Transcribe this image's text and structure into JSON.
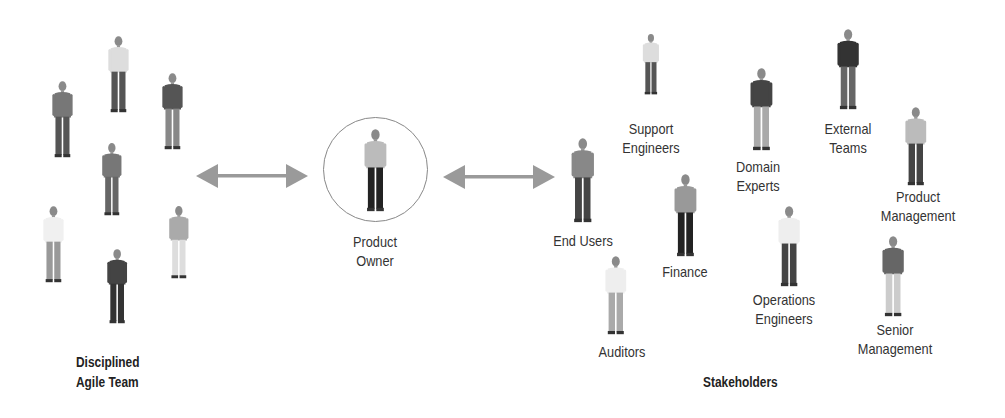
{
  "team": {
    "title": "Disciplined\nAgile Team",
    "members": [
      {
        "x": 62,
        "y": 80,
        "h": 78,
        "top": "#777",
        "bottom": "#555"
      },
      {
        "x": 118,
        "y": 35,
        "h": 78,
        "top": "#ddd",
        "bottom": "#555"
      },
      {
        "x": 172,
        "y": 72,
        "h": 78,
        "top": "#555",
        "bottom": "#888"
      },
      {
        "x": 112,
        "y": 142,
        "h": 74,
        "top": "#777",
        "bottom": "#666"
      },
      {
        "x": 53,
        "y": 205,
        "h": 78,
        "top": "#f0f0f0",
        "bottom": "#999"
      },
      {
        "x": 179,
        "y": 205,
        "h": 74,
        "top": "#aaa",
        "bottom": "#ddd"
      },
      {
        "x": 117,
        "y": 248,
        "h": 76,
        "top": "#444",
        "bottom": "#333"
      }
    ]
  },
  "product_owner": {
    "label": "Product\nOwner"
  },
  "stakeholders": {
    "title": "Stakeholders",
    "items": [
      {
        "label": "Support\nEngineers",
        "fx": 651,
        "fy": 33,
        "fh": 62,
        "lx": 651,
        "ly": 119,
        "top": "#ddd",
        "bottom": "#555"
      },
      {
        "label": "End Users",
        "fx": 583,
        "fy": 137,
        "fh": 86,
        "lx": 583,
        "ly": 231,
        "top": "#888",
        "bottom": "#444"
      },
      {
        "label": "Finance",
        "fx": 685,
        "fy": 173,
        "fh": 84,
        "lx": 685,
        "ly": 262,
        "top": "#999",
        "bottom": "#222"
      },
      {
        "label": "Auditors",
        "fx": 616,
        "fy": 255,
        "fh": 80,
        "lx": 622,
        "ly": 342,
        "top": "#eee",
        "bottom": "#aaa"
      },
      {
        "label": "Domain\nExperts",
        "fx": 761,
        "fy": 67,
        "fh": 84,
        "lx": 758,
        "ly": 157,
        "top": "#444",
        "bottom": "#aaa"
      },
      {
        "label": "External\nTeams",
        "fx": 848,
        "fy": 28,
        "fh": 82,
        "lx": 848,
        "ly": 119,
        "top": "#333",
        "bottom": "#666"
      },
      {
        "label": "Product\nManagement",
        "fx": 916,
        "fy": 106,
        "fh": 80,
        "lx": 918,
        "ly": 187,
        "top": "#bbb",
        "bottom": "#444"
      },
      {
        "label": "Operations\nEngineers",
        "fx": 789,
        "fy": 205,
        "fh": 82,
        "lx": 784,
        "ly": 290,
        "top": "#eee",
        "bottom": "#444"
      },
      {
        "label": "Senior\nManagement",
        "fx": 893,
        "fy": 235,
        "fh": 82,
        "lx": 895,
        "ly": 320,
        "top": "#666",
        "bottom": "#ccc"
      }
    ]
  },
  "colors": {
    "arrow": "#9a9a9a",
    "text": "#333333"
  }
}
